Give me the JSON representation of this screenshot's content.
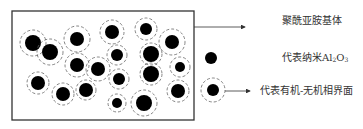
{
  "diagram": {
    "title": "",
    "box": {
      "x": 12,
      "y": 11,
      "w": 182,
      "h": 109,
      "stroke": "#333333"
    },
    "particle_color": "#000000",
    "interface_stroke": "#666666",
    "particles": [
      {
        "cx": 33,
        "cy": 43,
        "r": 8,
        "ri": 13
      },
      {
        "cx": 50,
        "cy": 52,
        "r": 8,
        "ri": 13
      },
      {
        "cx": 77,
        "cy": 39,
        "r": 7,
        "ri": 13
      },
      {
        "cx": 112,
        "cy": 32,
        "r": 7,
        "ri": 12
      },
      {
        "cx": 146,
        "cy": 29,
        "r": 6,
        "ri": 11
      },
      {
        "cx": 172,
        "cy": 42,
        "r": 7,
        "ri": 13
      },
      {
        "cx": 117,
        "cy": 55,
        "r": 6,
        "ri": 10
      },
      {
        "cx": 151,
        "cy": 54,
        "r": 8,
        "ri": 11
      },
      {
        "cx": 77,
        "cy": 65,
        "r": 7,
        "ri": 12
      },
      {
        "cx": 98,
        "cy": 69,
        "r": 7,
        "ri": 12
      },
      {
        "cx": 180,
        "cy": 67,
        "r": 5,
        "ri": 10
      },
      {
        "cx": 38,
        "cy": 83,
        "r": 7,
        "ri": 11
      },
      {
        "cx": 119,
        "cy": 79,
        "r": 6,
        "ri": 10
      },
      {
        "cx": 151,
        "cy": 74,
        "r": 8,
        "ri": 11
      },
      {
        "cx": 63,
        "cy": 94,
        "r": 7,
        "ri": 11
      },
      {
        "cx": 86,
        "cy": 90,
        "r": 7,
        "ri": 10
      },
      {
        "cx": 178,
        "cy": 91,
        "r": 7,
        "ri": 11
      },
      {
        "cx": 117,
        "cy": 103,
        "r": 5,
        "ri": 9
      },
      {
        "cx": 144,
        "cy": 103,
        "r": 8,
        "ri": 13
      }
    ],
    "legend": {
      "matrix_label": "聚酰亚胺基体",
      "nano_label_prefix": "代表纳米Al",
      "nano_label_sub1": "2",
      "nano_label_mid": "O",
      "nano_label_sub2": "3",
      "interface_label": "代表有机-无机相界面"
    }
  }
}
